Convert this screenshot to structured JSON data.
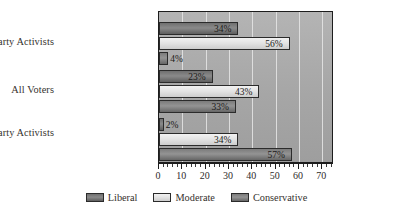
{
  "chart_data": {
    "type": "bar",
    "orientation": "horizontal",
    "title": "",
    "xlabel": "",
    "ylabel": "",
    "xlim": [
      0,
      75
    ],
    "xticks": [
      0,
      10,
      20,
      30,
      40,
      50,
      60,
      70
    ],
    "xtick_labels": [
      "0",
      "10",
      "20",
      "30",
      "40",
      "50",
      "60",
      "70"
    ],
    "grid": true,
    "legend_position": "bottom",
    "categories": [
      "Democratic Party Activists",
      "All Voters",
      "Republican Party Activists"
    ],
    "series": [
      {
        "name": "Liberal",
        "color": "#7a7a7a",
        "values": [
          34,
          23,
          2
        ],
        "labels": [
          "34%",
          "23%",
          "2%"
        ]
      },
      {
        "name": "Moderate",
        "color": "#e2e2e2",
        "values": [
          56,
          43,
          34
        ],
        "labels": [
          "56%",
          "43%",
          "34%"
        ]
      },
      {
        "name": "Conservative",
        "color": "#8a8a8a",
        "values": [
          4,
          33,
          57
        ],
        "labels": [
          "4%",
          "33%",
          "57%"
        ]
      }
    ]
  },
  "legend": {
    "items": [
      {
        "label": "Liberal"
      },
      {
        "label": "Moderate"
      },
      {
        "label": "Conservative"
      }
    ]
  },
  "style": {
    "plot_background": "#a8a8a8",
    "gridline_color": "#e6e6e6",
    "axis_color": "#1d1d1d",
    "text_color": "#35312e"
  }
}
